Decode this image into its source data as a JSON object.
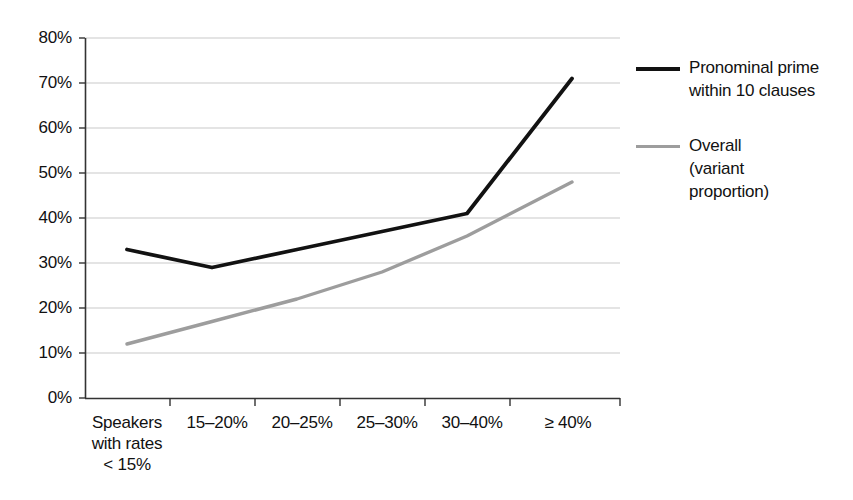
{
  "chart_data": {
    "type": "line",
    "title": "",
    "subtitle": "",
    "xlabel": "",
    "ylabel": "",
    "ylim": [
      0,
      80
    ],
    "grid": true,
    "legend_position": "right",
    "categories": [
      "Speakers with rates < 15%",
      "15–20%",
      "20–25%",
      "25–30%",
      "30–40%",
      "≥ 40%"
    ],
    "series": [
      {
        "name": "Pronominal prime within 10 clauses",
        "color": "#121212",
        "values": [
          33,
          29,
          33,
          37,
          41,
          71
        ]
      },
      {
        "name": "Overall (variant proportion)",
        "color": "#9d9d9d",
        "values": [
          12,
          17,
          22,
          28,
          36,
          48
        ]
      }
    ],
    "ytick_labels": [
      "0%",
      "10%",
      "20%",
      "30%",
      "40%",
      "50%",
      "60%",
      "70%",
      "80%"
    ],
    "ytick_values": [
      0,
      10,
      20,
      30,
      40,
      50,
      60,
      70,
      80
    ]
  },
  "axes": {
    "y_ticks": [
      {
        "label": "80%",
        "value": 80
      },
      {
        "label": "70%",
        "value": 70
      },
      {
        "label": "60%",
        "value": 60
      },
      {
        "label": "50%",
        "value": 50
      },
      {
        "label": "40%",
        "value": 40
      },
      {
        "label": "30%",
        "value": 30
      },
      {
        "label": "20%",
        "value": 20
      },
      {
        "label": "10%",
        "value": 10
      },
      {
        "label": "0%",
        "value": 0
      }
    ],
    "x_ticks": [
      {
        "line1": "Speakers",
        "line2": "with rates",
        "line3": "< 15%"
      },
      {
        "line1": "15–20%",
        "line2": "",
        "line3": ""
      },
      {
        "line1": "20–25%",
        "line2": "",
        "line3": ""
      },
      {
        "line1": "25–30%",
        "line2": "",
        "line3": ""
      },
      {
        "line1": "30–40%",
        "line2": "",
        "line3": ""
      },
      {
        "line1": "≥ 40%",
        "line2": "",
        "line3": ""
      }
    ]
  },
  "legend": {
    "items": [
      {
        "swatch": "dark",
        "line1": "Pronominal prime",
        "line2": "within 10 clauses",
        "line3": ""
      },
      {
        "swatch": "gray",
        "line1": "Overall",
        "line2": "(variant",
        "line3": "proportion)"
      }
    ]
  },
  "colors": {
    "series_dark": "#121212",
    "series_gray": "#9d9d9d",
    "grid": "#c9c9c9",
    "axis": "#333333",
    "background": "#ffffff"
  }
}
